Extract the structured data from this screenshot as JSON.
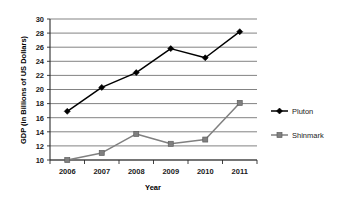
{
  "chart_data": {
    "type": "line",
    "title": "",
    "xlabel": "Year",
    "ylabel": "GDP (in Billions of US Dollars)",
    "categories": [
      "2006",
      "2007",
      "2008",
      "2009",
      "2010",
      "2011"
    ],
    "x": [
      2006,
      2007,
      2008,
      2009,
      2010,
      2011
    ],
    "series": [
      {
        "name": "Pluton",
        "color": "#000000",
        "marker": "diamond",
        "values": [
          16.9,
          20.3,
          22.4,
          25.8,
          24.5,
          28.2
        ]
      },
      {
        "name": "Shinmark",
        "color": "#808080",
        "marker": "square",
        "values": [
          10.0,
          11.0,
          13.7,
          12.3,
          12.9,
          18.1
        ]
      }
    ],
    "ylim": [
      10,
      30
    ],
    "ytick_step": 2,
    "yticks": [
      "10",
      "12",
      "14",
      "16",
      "18",
      "20",
      "22",
      "24",
      "26",
      "28",
      "30"
    ],
    "grid": true,
    "grid_axis": "y",
    "legend_position": "right",
    "background_color": "#ffffff",
    "plot_background_color": "#ffffff",
    "grid_color": "#4d4d4d",
    "axis_color": "#2b2b2b"
  },
  "legend": {
    "entries": [
      {
        "label": "Pluton"
      },
      {
        "label": "Shinmark"
      }
    ]
  }
}
